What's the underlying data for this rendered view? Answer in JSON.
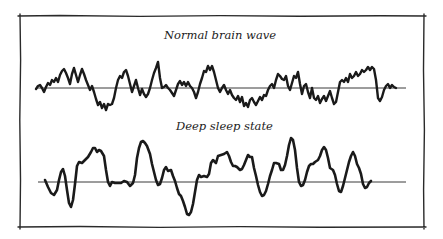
{
  "figure": {
    "panels": [
      {
        "id": "normal",
        "title": "Normal brain wave",
        "baseline_y": 88,
        "x_start": 36,
        "x_end": 406,
        "stroke_width": 2.4,
        "points": [
          [
            36,
            89
          ],
          [
            38,
            86
          ],
          [
            40,
            85
          ],
          [
            42,
            88
          ],
          [
            44,
            92
          ],
          [
            46,
            87
          ],
          [
            48,
            83
          ],
          [
            50,
            85
          ],
          [
            52,
            80
          ],
          [
            54,
            82
          ],
          [
            56,
            78
          ],
          [
            58,
            82
          ],
          [
            60,
            75
          ],
          [
            62,
            71
          ],
          [
            64,
            69
          ],
          [
            66,
            73
          ],
          [
            68,
            78
          ],
          [
            70,
            84
          ],
          [
            72,
            74
          ],
          [
            74,
            68
          ],
          [
            76,
            75
          ],
          [
            78,
            82
          ],
          [
            80,
            75
          ],
          [
            82,
            69
          ],
          [
            84,
            74
          ],
          [
            86,
            80
          ],
          [
            88,
            85
          ],
          [
            90,
            90
          ],
          [
            92,
            86
          ],
          [
            94,
            92
          ],
          [
            96,
            99
          ],
          [
            98,
            105
          ],
          [
            100,
            102
          ],
          [
            102,
            108
          ],
          [
            104,
            104
          ],
          [
            106,
            110
          ],
          [
            108,
            104
          ],
          [
            110,
            105
          ],
          [
            112,
            104
          ],
          [
            114,
            98
          ],
          [
            116,
            88
          ],
          [
            118,
            80
          ],
          [
            120,
            76
          ],
          [
            122,
            78
          ],
          [
            124,
            72
          ],
          [
            126,
            70
          ],
          [
            128,
            76
          ],
          [
            130,
            84
          ],
          [
            132,
            92
          ],
          [
            134,
            86
          ],
          [
            136,
            80
          ],
          [
            138,
            88
          ],
          [
            140,
            95
          ],
          [
            142,
            89
          ],
          [
            144,
            94
          ],
          [
            146,
            97
          ],
          [
            148,
            94
          ],
          [
            150,
            88
          ],
          [
            152,
            80
          ],
          [
            154,
            73
          ],
          [
            156,
            68
          ],
          [
            158,
            62
          ],
          [
            160,
            78
          ],
          [
            162,
            88
          ],
          [
            164,
            87
          ],
          [
            166,
            85
          ],
          [
            168,
            88
          ],
          [
            170,
            90
          ],
          [
            172,
            93
          ],
          [
            174,
            96
          ],
          [
            176,
            90
          ],
          [
            178,
            84
          ],
          [
            180,
            81
          ],
          [
            182,
            85
          ],
          [
            184,
            82
          ],
          [
            186,
            86
          ],
          [
            188,
            82
          ],
          [
            190,
            86
          ],
          [
            192,
            88
          ],
          [
            194,
            92
          ],
          [
            196,
            98
          ],
          [
            198,
            92
          ],
          [
            200,
            84
          ],
          [
            202,
            78
          ],
          [
            204,
            71
          ],
          [
            206,
            72
          ],
          [
            208,
            66
          ],
          [
            210,
            70
          ],
          [
            212,
            66
          ],
          [
            214,
            72
          ],
          [
            216,
            80
          ],
          [
            218,
            88
          ],
          [
            220,
            92
          ],
          [
            222,
            88
          ],
          [
            224,
            85
          ],
          [
            226,
            90
          ],
          [
            228,
            94
          ],
          [
            230,
            90
          ],
          [
            232,
            95
          ],
          [
            234,
            98
          ],
          [
            236,
            100
          ],
          [
            238,
            96
          ],
          [
            240,
            102
          ],
          [
            242,
            97
          ],
          [
            244,
            106
          ],
          [
            246,
            103
          ],
          [
            248,
            107
          ],
          [
            250,
            100
          ],
          [
            252,
            98
          ],
          [
            254,
            102
          ],
          [
            256,
            105
          ],
          [
            258,
            101
          ],
          [
            260,
            97
          ],
          [
            262,
            100
          ],
          [
            264,
            95
          ],
          [
            266,
            96
          ],
          [
            268,
            90
          ],
          [
            270,
            86
          ],
          [
            272,
            84
          ],
          [
            274,
            88
          ],
          [
            276,
            80
          ],
          [
            278,
            74
          ],
          [
            280,
            76
          ],
          [
            282,
            79
          ],
          [
            284,
            80
          ],
          [
            286,
            76
          ],
          [
            288,
            86
          ],
          [
            290,
            90
          ],
          [
            292,
            83
          ],
          [
            294,
            76
          ],
          [
            296,
            78
          ],
          [
            298,
            72
          ],
          [
            300,
            84
          ],
          [
            302,
            94
          ],
          [
            304,
            86
          ],
          [
            306,
            84
          ],
          [
            308,
            92
          ],
          [
            310,
            98
          ],
          [
            312,
            88
          ],
          [
            314,
            98
          ],
          [
            316,
            100
          ],
          [
            318,
            96
          ],
          [
            320,
            103
          ],
          [
            322,
            99
          ],
          [
            324,
            96
          ],
          [
            326,
            101
          ],
          [
            328,
            96
          ],
          [
            330,
            91
          ],
          [
            332,
            98
          ],
          [
            334,
            104
          ],
          [
            336,
            102
          ],
          [
            338,
            92
          ],
          [
            340,
            82
          ],
          [
            342,
            80
          ],
          [
            344,
            82
          ],
          [
            346,
            78
          ],
          [
            348,
            82
          ],
          [
            350,
            74
          ],
          [
            352,
            78
          ],
          [
            354,
            76
          ],
          [
            356,
            72
          ],
          [
            358,
            76
          ],
          [
            360,
            74
          ],
          [
            362,
            70
          ],
          [
            364,
            72
          ],
          [
            366,
            70
          ],
          [
            368,
            67
          ],
          [
            370,
            70
          ],
          [
            372,
            67
          ],
          [
            374,
            69
          ],
          [
            376,
            80
          ],
          [
            378,
            98
          ],
          [
            380,
            101
          ],
          [
            382,
            97
          ],
          [
            384,
            90
          ],
          [
            386,
            86
          ],
          [
            388,
            84
          ],
          [
            390,
            88
          ],
          [
            392,
            85
          ],
          [
            394,
            87
          ],
          [
            396,
            88
          ]
        ]
      },
      {
        "id": "deep_sleep",
        "title": "Deep sleep state",
        "baseline_y": 182,
        "x_start": 38,
        "x_end": 406,
        "stroke_width": 2.6,
        "points": [
          [
            45,
            180
          ],
          [
            48,
            187
          ],
          [
            51,
            193
          ],
          [
            54,
            195
          ],
          [
            57,
            190
          ],
          [
            59,
            180
          ],
          [
            61,
            172
          ],
          [
            63,
            169
          ],
          [
            65,
            176
          ],
          [
            67,
            190
          ],
          [
            69,
            203
          ],
          [
            71,
            207
          ],
          [
            73,
            200
          ],
          [
            75,
            184
          ],
          [
            77,
            166
          ],
          [
            79,
            162
          ],
          [
            82,
            163
          ],
          [
            85,
            160
          ],
          [
            88,
            157
          ],
          [
            91,
            152
          ],
          [
            93,
            148
          ],
          [
            95,
            148
          ],
          [
            97,
            152
          ],
          [
            99,
            150
          ],
          [
            101,
            151
          ],
          [
            104,
            156
          ],
          [
            106,
            170
          ],
          [
            108,
            182
          ],
          [
            110,
            186
          ],
          [
            112,
            182
          ],
          [
            115,
            183
          ],
          [
            118,
            183
          ],
          [
            121,
            183
          ],
          [
            124,
            181
          ],
          [
            127,
            182
          ],
          [
            130,
            186
          ],
          [
            133,
            183
          ],
          [
            135,
            175
          ],
          [
            137,
            158
          ],
          [
            139,
            148
          ],
          [
            141,
            142
          ],
          [
            143,
            141
          ],
          [
            145,
            143
          ],
          [
            147,
            146
          ],
          [
            150,
            154
          ],
          [
            152,
            164
          ],
          [
            154,
            172
          ],
          [
            156,
            180
          ],
          [
            158,
            185
          ],
          [
            160,
            184
          ],
          [
            162,
            178
          ],
          [
            164,
            170
          ],
          [
            166,
            167
          ],
          [
            168,
            171
          ],
          [
            171,
            170
          ],
          [
            173,
            176
          ],
          [
            175,
            181
          ],
          [
            177,
            188
          ],
          [
            179,
            194
          ],
          [
            181,
            196
          ],
          [
            183,
            201
          ],
          [
            185,
            207
          ],
          [
            187,
            214
          ],
          [
            189,
            215
          ],
          [
            191,
            212
          ],
          [
            193,
            204
          ],
          [
            195,
            192
          ],
          [
            197,
            180
          ],
          [
            199,
            175
          ],
          [
            201,
            177
          ],
          [
            204,
            176
          ],
          [
            207,
            177
          ],
          [
            209,
            174
          ],
          [
            211,
            163
          ],
          [
            213,
            160
          ],
          [
            216,
            163
          ],
          [
            218,
            156
          ],
          [
            221,
            155
          ],
          [
            224,
            154
          ],
          [
            227,
            152
          ],
          [
            229,
            156
          ],
          [
            231,
            162
          ],
          [
            233,
            166
          ],
          [
            235,
            166
          ],
          [
            237,
            167
          ],
          [
            240,
            170
          ],
          [
            242,
            169
          ],
          [
            244,
            165
          ],
          [
            246,
            160
          ],
          [
            248,
            155
          ],
          [
            250,
            157
          ],
          [
            252,
            157
          ],
          [
            254,
            168
          ],
          [
            256,
            176
          ],
          [
            258,
            185
          ],
          [
            260,
            192
          ],
          [
            262,
            196
          ],
          [
            264,
            195
          ],
          [
            266,
            191
          ],
          [
            268,
            184
          ],
          [
            270,
            176
          ],
          [
            272,
            170
          ],
          [
            274,
            163
          ],
          [
            276,
            163
          ],
          [
            279,
            164
          ],
          [
            281,
            170
          ],
          [
            283,
            170
          ],
          [
            285,
            165
          ],
          [
            287,
            156
          ],
          [
            289,
            145
          ],
          [
            291,
            138
          ],
          [
            293,
            140
          ],
          [
            295,
            150
          ],
          [
            297,
            168
          ],
          [
            299,
            182
          ],
          [
            301,
            186
          ],
          [
            303,
            185
          ],
          [
            305,
            180
          ],
          [
            307,
            172
          ],
          [
            309,
            166
          ],
          [
            311,
            164
          ],
          [
            313,
            164
          ],
          [
            315,
            162
          ],
          [
            318,
            160
          ],
          [
            320,
            156
          ],
          [
            322,
            150
          ],
          [
            324,
            147
          ],
          [
            326,
            150
          ],
          [
            328,
            158
          ],
          [
            330,
            168
          ],
          [
            333,
            170
          ],
          [
            335,
            175
          ],
          [
            337,
            184
          ],
          [
            339,
            191
          ],
          [
            341,
            192
          ],
          [
            343,
            186
          ],
          [
            345,
            178
          ],
          [
            347,
            170
          ],
          [
            349,
            162
          ],
          [
            351,
            156
          ],
          [
            353,
            152
          ],
          [
            355,
            156
          ],
          [
            357,
            164
          ],
          [
            359,
            168
          ],
          [
            361,
            174
          ],
          [
            363,
            184
          ],
          [
            365,
            188
          ],
          [
            367,
            187
          ],
          [
            369,
            183
          ],
          [
            371,
            181
          ]
        ]
      }
    ],
    "frame": {
      "left": 20,
      "top": 16,
      "right": 424,
      "bottom": 227,
      "stroke_color": "#2a2a2a"
    },
    "colors": {
      "ink": "#1a1a1a",
      "baseline": "#3a3a3a",
      "background": "#ffffff"
    }
  }
}
